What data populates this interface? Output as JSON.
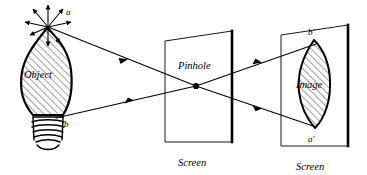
{
  "figure": {
    "kind": "optics-ray-diagram",
    "title_text": "",
    "background_color": "#ffffff",
    "ink_color": "#000000",
    "hatch_color": "#000000"
  },
  "object": {
    "name": "light-bulb-object",
    "label": "Object",
    "point_top_label": "a",
    "point_bottom_label": "b",
    "emission_arrow_count": 8,
    "screw_thread_count": 5,
    "hatched": true
  },
  "pinhole_screen": {
    "label_inside": "Pinhole",
    "label_below": "Screen",
    "aperture_marker": "pinhole-dot"
  },
  "image_screen": {
    "label_inside": "Image",
    "label_below": "Screen",
    "point_top_label": "b'",
    "point_bottom_label": "a'",
    "hatched": true,
    "inverted": true
  },
  "rays": [
    {
      "name": "ray-a-to-pinhole",
      "from": "a",
      "to": "pinhole"
    },
    {
      "name": "ray-b-to-pinhole",
      "from": "b",
      "to": "pinhole"
    },
    {
      "name": "ray-pinhole-to-b-prime",
      "from": "pinhole",
      "to": "b'"
    },
    {
      "name": "ray-pinhole-to-a-prime",
      "from": "pinhole",
      "to": "a'"
    }
  ]
}
